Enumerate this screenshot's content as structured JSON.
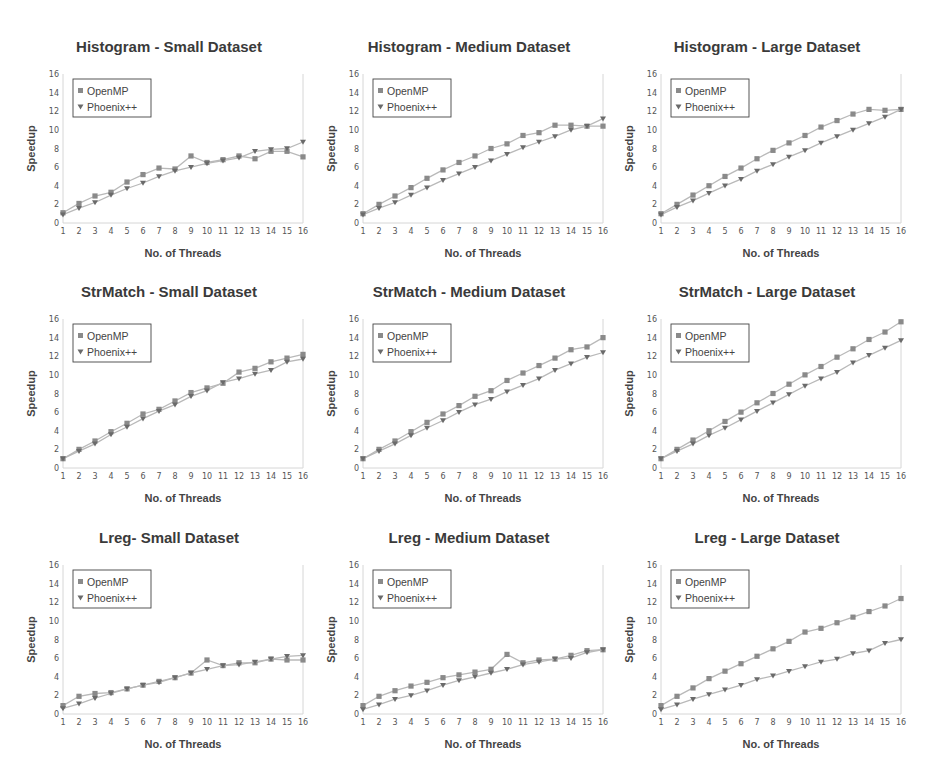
{
  "legend": {
    "series": [
      "OpenMP",
      "Phoenix++"
    ]
  },
  "colors": {
    "line": "#b9b9b9",
    "marker_openmp": "#8a8a8a",
    "marker_phoenix": "#6a6a6a",
    "title": "#3a3a3a",
    "axis": "#d6d6d6"
  },
  "chart_data": [
    {
      "type": "line",
      "title": "Histogram - Small Dataset",
      "xlabel": "No. of Threads",
      "ylabel": "Speedup",
      "x": [
        1,
        2,
        3,
        4,
        5,
        6,
        7,
        8,
        9,
        10,
        11,
        12,
        13,
        14,
        15,
        16
      ],
      "ylim": [
        0,
        16
      ],
      "yticks": [
        0,
        2,
        4,
        6,
        8,
        10,
        12,
        14,
        16
      ],
      "legend_position": "upper left",
      "grid": false,
      "series": [
        {
          "name": "OpenMP",
          "marker": "square",
          "values": [
            1.1,
            2.1,
            2.9,
            3.3,
            4.4,
            5.2,
            5.9,
            5.8,
            7.2,
            6.5,
            6.8,
            7.2,
            6.9,
            7.7,
            7.7,
            7.1
          ]
        },
        {
          "name": "Phoenix++",
          "marker": "triangle-down",
          "values": [
            0.9,
            1.6,
            2.2,
            3.0,
            3.7,
            4.3,
            5.0,
            5.6,
            6.0,
            6.4,
            6.7,
            7.0,
            7.7,
            7.9,
            8.0,
            8.7
          ]
        }
      ]
    },
    {
      "type": "line",
      "title": "Histogram - Medium Dataset",
      "xlabel": "No. of Threads",
      "ylabel": "Speedup",
      "x": [
        1,
        2,
        3,
        4,
        5,
        6,
        7,
        8,
        9,
        10,
        11,
        12,
        13,
        14,
        15,
        16
      ],
      "ylim": [
        0,
        16
      ],
      "yticks": [
        0,
        2,
        4,
        6,
        8,
        10,
        12,
        14,
        16
      ],
      "legend_position": "upper left",
      "grid": false,
      "series": [
        {
          "name": "OpenMP",
          "marker": "square",
          "values": [
            1.0,
            2.0,
            2.9,
            3.8,
            4.8,
            5.7,
            6.5,
            7.2,
            8.0,
            8.5,
            9.4,
            9.7,
            10.5,
            10.5,
            10.4,
            10.4
          ]
        },
        {
          "name": "Phoenix++",
          "marker": "triangle-down",
          "values": [
            0.9,
            1.6,
            2.2,
            3.0,
            3.8,
            4.6,
            5.3,
            6.0,
            6.7,
            7.4,
            8.1,
            8.7,
            9.3,
            10.0,
            10.4,
            11.2
          ]
        }
      ]
    },
    {
      "type": "line",
      "title": "Histogram - Large Dataset",
      "xlabel": "No. of Threads",
      "ylabel": "Speedup",
      "x": [
        1,
        2,
        3,
        4,
        5,
        6,
        7,
        8,
        9,
        10,
        11,
        12,
        13,
        14,
        15,
        16
      ],
      "ylim": [
        0,
        16
      ],
      "yticks": [
        0,
        2,
        4,
        6,
        8,
        10,
        12,
        14,
        16
      ],
      "legend_position": "upper left",
      "grid": false,
      "series": [
        {
          "name": "OpenMP",
          "marker": "square",
          "values": [
            1.0,
            2.0,
            3.0,
            4.0,
            5.0,
            5.9,
            6.9,
            7.8,
            8.6,
            9.4,
            10.3,
            11.0,
            11.7,
            12.2,
            12.1,
            12.2
          ]
        },
        {
          "name": "Phoenix++",
          "marker": "triangle-down",
          "values": [
            0.9,
            1.7,
            2.4,
            3.2,
            4.0,
            4.7,
            5.6,
            6.3,
            7.1,
            7.8,
            8.6,
            9.3,
            10.0,
            10.7,
            11.4,
            12.2
          ]
        }
      ]
    },
    {
      "type": "line",
      "title": "StrMatch - Small Dataset",
      "xlabel": "No. of Threads",
      "ylabel": "Speedup",
      "x": [
        1,
        2,
        3,
        4,
        5,
        6,
        7,
        8,
        9,
        10,
        11,
        12,
        13,
        14,
        15,
        16
      ],
      "ylim": [
        0,
        16
      ],
      "yticks": [
        0,
        2,
        4,
        6,
        8,
        10,
        12,
        14,
        16
      ],
      "legend_position": "upper left",
      "grid": false,
      "series": [
        {
          "name": "OpenMP",
          "marker": "square",
          "values": [
            1.0,
            2.0,
            2.9,
            3.9,
            4.8,
            5.8,
            6.3,
            7.2,
            8.1,
            8.6,
            9.1,
            10.3,
            10.7,
            11.4,
            11.8,
            12.2
          ]
        },
        {
          "name": "Phoenix++",
          "marker": "triangle-down",
          "values": [
            1.0,
            1.8,
            2.6,
            3.6,
            4.4,
            5.3,
            6.1,
            6.8,
            7.7,
            8.3,
            9.2,
            9.6,
            10.1,
            10.5,
            11.4,
            11.7
          ]
        }
      ]
    },
    {
      "type": "line",
      "title": "StrMatch - Medium Dataset",
      "xlabel": "No. of Threads",
      "ylabel": "Speedup",
      "x": [
        1,
        2,
        3,
        4,
        5,
        6,
        7,
        8,
        9,
        10,
        11,
        12,
        13,
        14,
        15,
        16
      ],
      "ylim": [
        0,
        16
      ],
      "yticks": [
        0,
        2,
        4,
        6,
        8,
        10,
        12,
        14,
        16
      ],
      "legend_position": "upper left",
      "grid": false,
      "series": [
        {
          "name": "OpenMP",
          "marker": "square",
          "values": [
            1.0,
            2.0,
            2.9,
            3.9,
            4.9,
            5.8,
            6.7,
            7.7,
            8.3,
            9.4,
            10.2,
            11.0,
            11.8,
            12.7,
            13.0,
            14.0
          ]
        },
        {
          "name": "Phoenix++",
          "marker": "triangle-down",
          "values": [
            1.0,
            1.8,
            2.6,
            3.5,
            4.3,
            5.1,
            6.0,
            6.8,
            7.4,
            8.2,
            8.9,
            9.6,
            10.5,
            11.2,
            11.9,
            12.4
          ]
        }
      ]
    },
    {
      "type": "line",
      "title": "StrMatch - Large Dataset",
      "xlabel": "No. of Threads",
      "ylabel": "Speedup",
      "x": [
        1,
        2,
        3,
        4,
        5,
        6,
        7,
        8,
        9,
        10,
        11,
        12,
        13,
        14,
        15,
        16
      ],
      "ylim": [
        0,
        16
      ],
      "yticks": [
        0,
        2,
        4,
        6,
        8,
        10,
        12,
        14,
        16
      ],
      "legend_position": "upper left",
      "grid": false,
      "series": [
        {
          "name": "OpenMP",
          "marker": "square",
          "values": [
            1.0,
            2.0,
            3.0,
            4.0,
            5.0,
            6.0,
            7.0,
            8.0,
            9.0,
            10.0,
            10.9,
            11.9,
            12.8,
            13.8,
            14.6,
            15.7
          ]
        },
        {
          "name": "Phoenix++",
          "marker": "triangle-down",
          "values": [
            1.0,
            1.8,
            2.6,
            3.5,
            4.3,
            5.2,
            6.1,
            7.0,
            7.9,
            8.8,
            9.6,
            10.3,
            11.3,
            12.1,
            12.9,
            13.7
          ]
        }
      ]
    },
    {
      "type": "line",
      "title": "Lreg- Small Dataset",
      "xlabel": "No. of Threads",
      "ylabel": "Speedup",
      "x": [
        1,
        2,
        3,
        4,
        5,
        6,
        7,
        8,
        9,
        10,
        11,
        12,
        13,
        14,
        15,
        16
      ],
      "ylim": [
        0,
        16
      ],
      "yticks": [
        0,
        2,
        4,
        6,
        8,
        10,
        12,
        14,
        16
      ],
      "legend_position": "upper left",
      "grid": false,
      "series": [
        {
          "name": "OpenMP",
          "marker": "square",
          "values": [
            0.9,
            1.9,
            2.2,
            2.3,
            2.7,
            3.1,
            3.5,
            3.9,
            4.4,
            5.8,
            5.2,
            5.5,
            5.5,
            5.9,
            5.8,
            5.8
          ]
        },
        {
          "name": "Phoenix++",
          "marker": "triangle-down",
          "values": [
            0.6,
            1.1,
            1.7,
            2.2,
            2.7,
            3.1,
            3.4,
            3.9,
            4.4,
            4.8,
            5.2,
            5.3,
            5.6,
            5.9,
            6.2,
            6.3
          ]
        }
      ]
    },
    {
      "type": "line",
      "title": "Lreg - Medium Dataset",
      "xlabel": "No. of Threads",
      "ylabel": "Speedup",
      "x": [
        1,
        2,
        3,
        4,
        5,
        6,
        7,
        8,
        9,
        10,
        11,
        12,
        13,
        14,
        15,
        16
      ],
      "ylim": [
        0,
        16
      ],
      "yticks": [
        0,
        2,
        4,
        6,
        8,
        10,
        12,
        14,
        16
      ],
      "legend_position": "upper left",
      "grid": false,
      "series": [
        {
          "name": "OpenMP",
          "marker": "square",
          "values": [
            0.9,
            1.9,
            2.5,
            3.0,
            3.4,
            3.9,
            4.2,
            4.5,
            4.8,
            6.4,
            5.5,
            5.8,
            5.9,
            6.3,
            6.8,
            6.9
          ]
        },
        {
          "name": "Phoenix++",
          "marker": "triangle-down",
          "values": [
            0.5,
            1.0,
            1.6,
            2.0,
            2.5,
            3.1,
            3.6,
            4.0,
            4.4,
            4.8,
            5.3,
            5.6,
            5.9,
            6.0,
            6.6,
            6.9
          ]
        }
      ]
    },
    {
      "type": "line",
      "title": "Lreg - Large Dataset",
      "xlabel": "No. of Threads",
      "ylabel": "Speedup",
      "x": [
        1,
        2,
        3,
        4,
        5,
        6,
        7,
        8,
        9,
        10,
        11,
        12,
        13,
        14,
        15,
        16
      ],
      "ylim": [
        0,
        16
      ],
      "yticks": [
        0,
        2,
        4,
        6,
        8,
        10,
        12,
        14,
        16
      ],
      "legend_position": "upper left",
      "grid": false,
      "series": [
        {
          "name": "OpenMP",
          "marker": "square",
          "values": [
            0.9,
            1.9,
            2.8,
            3.8,
            4.6,
            5.4,
            6.2,
            7.0,
            7.8,
            8.8,
            9.2,
            9.8,
            10.4,
            11.0,
            11.6,
            12.4
          ]
        },
        {
          "name": "Phoenix++",
          "marker": "triangle-down",
          "values": [
            0.5,
            1.0,
            1.6,
            2.1,
            2.6,
            3.1,
            3.7,
            4.1,
            4.6,
            5.1,
            5.6,
            5.9,
            6.5,
            6.8,
            7.6,
            8.0
          ]
        }
      ]
    }
  ]
}
